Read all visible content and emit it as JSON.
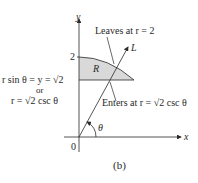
{
  "figure": {
    "caption": "(b)",
    "axes": {
      "x_label": "x",
      "y_label": "y",
      "origin_label": "0",
      "y_tick_2": "2"
    },
    "region_label": "R",
    "ray_label": "L",
    "angle_label": "θ",
    "annotations": {
      "leaves": "Leaves at r = 2",
      "enters": "Enters at r = √2 csc θ",
      "line_eq_1": "r sin θ = y = √2",
      "line_eq_or": "or",
      "line_eq_2": "r = √2 csc θ"
    },
    "colors": {
      "region_fill": "#d9d9d9",
      "stroke": "#2a2a2a"
    }
  }
}
